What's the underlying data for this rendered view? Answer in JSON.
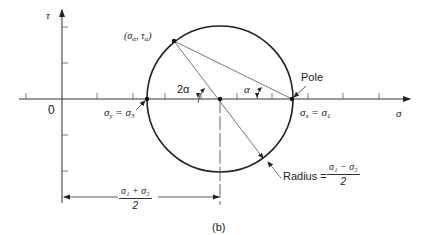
{
  "figure_label": "(b)",
  "axes": {
    "y_label": "τ",
    "x_label": "σ",
    "origin_label": "0"
  },
  "points": {
    "general": {
      "label_open": "(σ",
      "sub1": "α",
      "sep": ", τ",
      "sub2": "α",
      "label_close": ")"
    },
    "left": {
      "label_pre": "σ",
      "sub1": "y",
      "eq": " = σ",
      "sub2": "3"
    },
    "pole": {
      "name": "Pole",
      "label_pre": "σ",
      "sub1": "x",
      "eq": " = σ",
      "sub2": "1"
    }
  },
  "angles": {
    "center_angle": "2α",
    "pole_angle": "α"
  },
  "radius": {
    "prefix": "Radius =",
    "numerator": "σ₁ − σ₃",
    "denominator": "2"
  },
  "center_dimension": {
    "numerator": "σ₁ + σ₃",
    "denominator": "2"
  },
  "colors": {
    "stroke": "#222222",
    "thin": "#555555",
    "background": "#ffffff"
  }
}
